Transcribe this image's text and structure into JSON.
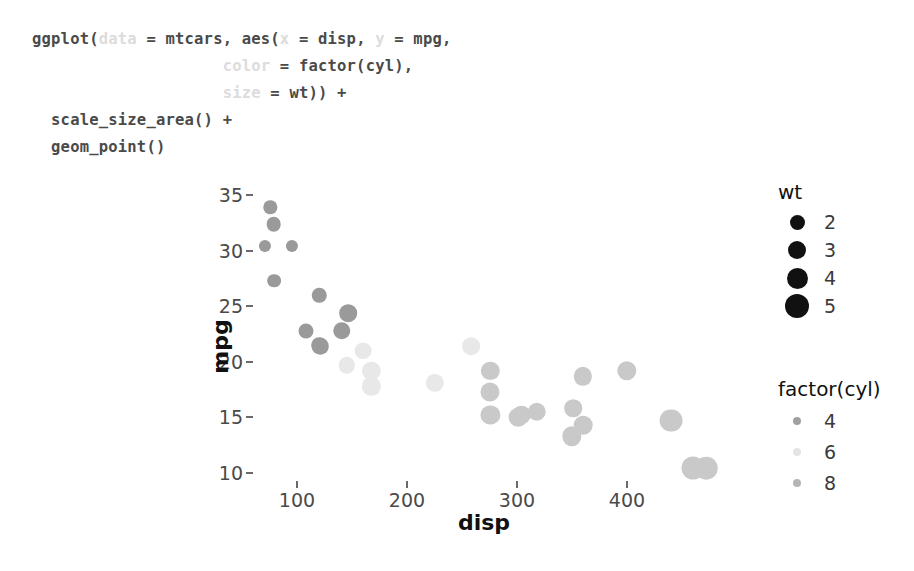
{
  "code": {
    "lines": [
      [
        {
          "t": "ggplot(",
          "style": "dark"
        },
        {
          "t": "data",
          "style": "faint"
        },
        {
          "t": " = mtcars, aes(",
          "style": "dark"
        },
        {
          "t": "x",
          "style": "faint"
        },
        {
          "t": " = disp, ",
          "style": "dark"
        },
        {
          "t": "y",
          "style": "faint"
        },
        {
          "t": " = mpg,",
          "style": "dark"
        }
      ],
      [
        {
          "t": "                    ",
          "style": "dark"
        },
        {
          "t": "color",
          "style": "faint"
        },
        {
          "t": " = factor(cyl),",
          "style": "dark"
        }
      ],
      [
        {
          "t": "                    ",
          "style": "dark"
        },
        {
          "t": "size",
          "style": "faint"
        },
        {
          "t": " = wt)) +",
          "style": "dark"
        }
      ],
      [
        {
          "t": "  scale_size_area() +",
          "style": "dark"
        }
      ],
      [
        {
          "t": "  geom_point()",
          "style": "dark"
        }
      ]
    ]
  },
  "chart_data": {
    "type": "scatter",
    "title": "",
    "xlabel": "disp",
    "ylabel": "mpg",
    "xlim": [
      60,
      480
    ],
    "ylim": [
      9,
      36
    ],
    "xticks": [
      100,
      200,
      300,
      400
    ],
    "yticks": [
      35,
      30,
      25,
      20,
      15,
      10
    ],
    "grid": false,
    "size_aes": "wt",
    "color_aes": "factor(cyl)",
    "colors": {
      "cyl4": "#9a9a9a",
      "cyl6": "#e8e8e8",
      "cyl8": "#c9c9c9"
    },
    "series": [
      {
        "name": "4",
        "color": "#9a9a9a",
        "points": [
          {
            "x": 108,
            "y": 22.8,
            "wt": 2.32
          },
          {
            "x": 146.7,
            "y": 24.4,
            "wt": 3.19
          },
          {
            "x": 140.8,
            "y": 22.8,
            "wt": 3.15
          },
          {
            "x": 78.7,
            "y": 32.4,
            "wt": 2.2
          },
          {
            "x": 75.7,
            "y": 33.9,
            "wt": 1.835
          },
          {
            "x": 71.1,
            "y": 30.4,
            "wt": 1.513
          },
          {
            "x": 120.1,
            "y": 21.5,
            "wt": 2.465
          },
          {
            "x": 79.0,
            "y": 27.3,
            "wt": 1.935
          },
          {
            "x": 120.3,
            "y": 26.0,
            "wt": 2.14
          },
          {
            "x": 95.1,
            "y": 30.4,
            "wt": 1.513
          },
          {
            "x": 121.0,
            "y": 21.4,
            "wt": 2.78
          }
        ]
      },
      {
        "name": "6",
        "color": "#e8e8e8",
        "points": [
          {
            "x": 160.0,
            "y": 21.0,
            "wt": 2.62
          },
          {
            "x": 160.0,
            "y": 21.0,
            "wt": 2.875
          },
          {
            "x": 258.0,
            "y": 21.4,
            "wt": 3.215
          },
          {
            "x": 225.0,
            "y": 18.1,
            "wt": 3.46
          },
          {
            "x": 167.6,
            "y": 19.2,
            "wt": 3.44
          },
          {
            "x": 167.6,
            "y": 17.8,
            "wt": 3.44
          },
          {
            "x": 145.0,
            "y": 19.7,
            "wt": 2.77
          }
        ]
      },
      {
        "name": "8",
        "color": "#c9c9c9",
        "points": [
          {
            "x": 360.0,
            "y": 18.7,
            "wt": 3.44
          },
          {
            "x": 360.0,
            "y": 14.3,
            "wt": 3.57
          },
          {
            "x": 275.8,
            "y": 19.2,
            "wt": 3.44
          },
          {
            "x": 275.8,
            "y": 17.3,
            "wt": 3.73
          },
          {
            "x": 275.8,
            "y": 15.2,
            "wt": 3.78
          },
          {
            "x": 472.0,
            "y": 10.4,
            "wt": 5.25
          },
          {
            "x": 460.0,
            "y": 10.4,
            "wt": 5.424
          },
          {
            "x": 440.0,
            "y": 14.7,
            "wt": 5.345
          },
          {
            "x": 318.0,
            "y": 15.5,
            "wt": 3.52
          },
          {
            "x": 304.0,
            "y": 15.2,
            "wt": 3.435
          },
          {
            "x": 350.0,
            "y": 13.3,
            "wt": 3.84
          },
          {
            "x": 400.0,
            "y": 19.2,
            "wt": 3.845
          },
          {
            "x": 351.0,
            "y": 15.8,
            "wt": 3.17
          },
          {
            "x": 301.0,
            "y": 15.0,
            "wt": 3.57
          }
        ]
      }
    ]
  },
  "legends": [
    {
      "id": "wt",
      "title": "wt",
      "items": [
        {
          "label": "2",
          "dot": 15,
          "color": "#111111"
        },
        {
          "label": "3",
          "dot": 18,
          "color": "#111111"
        },
        {
          "label": "4",
          "dot": 21,
          "color": "#111111"
        },
        {
          "label": "5",
          "dot": 24,
          "color": "#111111"
        }
      ]
    },
    {
      "id": "cyl",
      "title": "factor(cyl)",
      "items": [
        {
          "label": "4",
          "dot": 8,
          "color": "#a0a0a0"
        },
        {
          "label": "6",
          "dot": 8,
          "color": "#e4e4e4"
        },
        {
          "label": "8",
          "dot": 8,
          "color": "#b5b5b5"
        }
      ]
    }
  ]
}
